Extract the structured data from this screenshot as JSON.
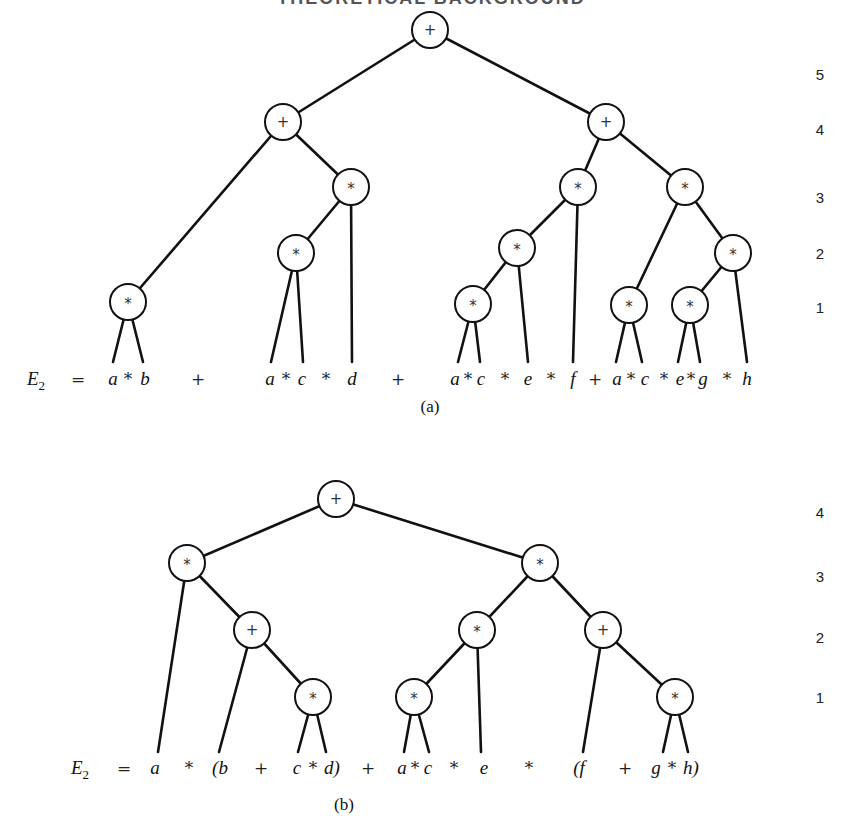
{
  "header": {
    "title": "THEORETICAL BACKGROUND"
  },
  "figures": [
    {
      "id": "a",
      "caption": "(a)",
      "expression_label": "E",
      "expression_subscript": "2",
      "equals": "=",
      "levels": [
        {
          "label": "5",
          "y": 80
        },
        {
          "label": "4",
          "y": 135
        },
        {
          "label": "3",
          "y": 203
        },
        {
          "label": "2",
          "y": 259
        },
        {
          "label": "1",
          "y": 313
        }
      ],
      "nodes": [
        {
          "id": "r",
          "op": "+",
          "x": 430,
          "y": 30
        },
        {
          "id": "n4a",
          "op": "+",
          "x": 283,
          "y": 122
        },
        {
          "id": "n4b",
          "op": "+",
          "x": 606,
          "y": 122
        },
        {
          "id": "n3a",
          "op": "*",
          "x": 351,
          "y": 187
        },
        {
          "id": "n3b",
          "op": "*",
          "x": 578,
          "y": 187
        },
        {
          "id": "n3c",
          "op": "*",
          "x": 685,
          "y": 187
        },
        {
          "id": "n2a",
          "op": "*",
          "x": 296,
          "y": 253
        },
        {
          "id": "n2b",
          "op": "*",
          "x": 517,
          "y": 248
        },
        {
          "id": "n2c",
          "op": "*",
          "x": 733,
          "y": 253
        },
        {
          "id": "n1a",
          "op": "*",
          "x": 128,
          "y": 302
        },
        {
          "id": "n1b",
          "op": "*",
          "x": 473,
          "y": 304
        },
        {
          "id": "n1c",
          "op": "*",
          "x": 629,
          "y": 305
        },
        {
          "id": "n1d",
          "op": "*",
          "x": 690,
          "y": 305
        }
      ],
      "edges": [
        [
          430,
          30,
          283,
          122
        ],
        [
          430,
          30,
          606,
          122
        ],
        [
          283,
          122,
          128,
          302
        ],
        [
          283,
          122,
          351,
          187
        ],
        [
          351,
          187,
          296,
          253
        ],
        [
          351,
          187,
          352,
          362
        ],
        [
          296,
          253,
          271,
          362
        ],
        [
          296,
          253,
          303,
          362
        ],
        [
          128,
          302,
          113,
          362
        ],
        [
          128,
          302,
          143,
          362
        ],
        [
          606,
          122,
          578,
          187
        ],
        [
          606,
          122,
          685,
          187
        ],
        [
          578,
          187,
          517,
          248
        ],
        [
          578,
          187,
          573,
          362
        ],
        [
          517,
          248,
          473,
          304
        ],
        [
          517,
          248,
          528,
          362
        ],
        [
          473,
          304,
          458,
          362
        ],
        [
          473,
          304,
          480,
          362
        ],
        [
          685,
          187,
          629,
          305
        ],
        [
          685,
          187,
          733,
          253
        ],
        [
          629,
          305,
          616,
          362
        ],
        [
          629,
          305,
          642,
          362
        ],
        [
          733,
          253,
          690,
          305
        ],
        [
          733,
          253,
          747,
          362
        ],
        [
          690,
          305,
          678,
          362
        ],
        [
          690,
          305,
          700,
          362
        ]
      ],
      "expression_tokens": [
        {
          "t": "a",
          "x": 113,
          "kind": "var"
        },
        {
          "t": "*",
          "x": 128,
          "kind": "op"
        },
        {
          "t": "b",
          "x": 145,
          "kind": "var"
        },
        {
          "t": "+",
          "x": 198,
          "kind": "op"
        },
        {
          "t": "a",
          "x": 270,
          "kind": "var"
        },
        {
          "t": "*",
          "x": 286,
          "kind": "op"
        },
        {
          "t": "c",
          "x": 302,
          "kind": "var"
        },
        {
          "t": "*",
          "x": 326,
          "kind": "op"
        },
        {
          "t": "d",
          "x": 352,
          "kind": "var"
        },
        {
          "t": "+",
          "x": 398,
          "kind": "op"
        },
        {
          "t": "a",
          "x": 455,
          "kind": "var"
        },
        {
          "t": "*",
          "x": 468,
          "kind": "op"
        },
        {
          "t": "c",
          "x": 481,
          "kind": "var"
        },
        {
          "t": "*",
          "x": 505,
          "kind": "op"
        },
        {
          "t": "e",
          "x": 528,
          "kind": "var"
        },
        {
          "t": "*",
          "x": 551,
          "kind": "op"
        },
        {
          "t": "f",
          "x": 573,
          "kind": "var"
        },
        {
          "t": "+",
          "x": 595,
          "kind": "op"
        },
        {
          "t": "a",
          "x": 617,
          "kind": "var"
        },
        {
          "t": "*",
          "x": 631,
          "kind": "op"
        },
        {
          "t": "c",
          "x": 645,
          "kind": "var"
        },
        {
          "t": "*",
          "x": 664,
          "kind": "op"
        },
        {
          "t": "e",
          "x": 680,
          "kind": "var"
        },
        {
          "t": "*",
          "x": 691,
          "kind": "op"
        },
        {
          "t": "g",
          "x": 703,
          "kind": "var"
        },
        {
          "t": "*",
          "x": 727,
          "kind": "op"
        },
        {
          "t": "h",
          "x": 747,
          "kind": "var"
        }
      ],
      "expression_y": 385,
      "label_x": 36,
      "equals_x": 78,
      "caption_x": 430,
      "caption_y": 412
    },
    {
      "id": "b",
      "caption": "(b)",
      "expression_label": "E",
      "expression_subscript": "2",
      "equals": "=",
      "levels": [
        {
          "label": "4",
          "y": 518
        },
        {
          "label": "3",
          "y": 582
        },
        {
          "label": "2",
          "y": 643
        },
        {
          "label": "1",
          "y": 703
        }
      ],
      "nodes": [
        {
          "id": "r",
          "op": "+",
          "x": 336,
          "y": 499
        },
        {
          "id": "n3a",
          "op": "*",
          "x": 187,
          "y": 563
        },
        {
          "id": "n3b",
          "op": "*",
          "x": 540,
          "y": 563
        },
        {
          "id": "n2a",
          "op": "+",
          "x": 252,
          "y": 630
        },
        {
          "id": "n2b",
          "op": "*",
          "x": 477,
          "y": 630
        },
        {
          "id": "n2c",
          "op": "+",
          "x": 603,
          "y": 630
        },
        {
          "id": "n1a",
          "op": "*",
          "x": 313,
          "y": 697
        },
        {
          "id": "n1b",
          "op": "*",
          "x": 414,
          "y": 697
        },
        {
          "id": "n1c",
          "op": "*",
          "x": 675,
          "y": 697
        }
      ],
      "edges": [
        [
          336,
          499,
          187,
          563
        ],
        [
          336,
          499,
          540,
          563
        ],
        [
          187,
          563,
          158,
          752
        ],
        [
          187,
          563,
          252,
          630
        ],
        [
          252,
          630,
          219,
          752
        ],
        [
          252,
          630,
          313,
          697
        ],
        [
          313,
          697,
          298,
          752
        ],
        [
          313,
          697,
          326,
          752
        ],
        [
          540,
          563,
          477,
          630
        ],
        [
          540,
          563,
          603,
          630
        ],
        [
          477,
          630,
          414,
          697
        ],
        [
          477,
          630,
          481,
          752
        ],
        [
          414,
          697,
          404,
          752
        ],
        [
          414,
          697,
          429,
          752
        ],
        [
          603,
          630,
          583,
          752
        ],
        [
          603,
          630,
          675,
          697
        ],
        [
          675,
          697,
          663,
          752
        ],
        [
          675,
          697,
          688,
          752
        ]
      ],
      "expression_tokens": [
        {
          "t": "a",
          "x": 155,
          "kind": "var"
        },
        {
          "t": "*",
          "x": 189,
          "kind": "op"
        },
        {
          "t": "(b",
          "x": 220,
          "kind": "var"
        },
        {
          "t": "+",
          "x": 261,
          "kind": "op"
        },
        {
          "t": "c",
          "x": 297,
          "kind": "var"
        },
        {
          "t": "*",
          "x": 313,
          "kind": "op"
        },
        {
          "t": "d)",
          "x": 332,
          "kind": "var"
        },
        {
          "t": "+",
          "x": 368,
          "kind": "op"
        },
        {
          "t": "a",
          "x": 402,
          "kind": "var"
        },
        {
          "t": "*",
          "x": 415,
          "kind": "op"
        },
        {
          "t": "c",
          "x": 428,
          "kind": "var"
        },
        {
          "t": "*",
          "x": 454,
          "kind": "op"
        },
        {
          "t": "e",
          "x": 484,
          "kind": "var"
        },
        {
          "t": "*",
          "x": 529,
          "kind": "op"
        },
        {
          "t": "(f",
          "x": 579,
          "kind": "var"
        },
        {
          "t": "+",
          "x": 625,
          "kind": "op"
        },
        {
          "t": "g",
          "x": 656,
          "kind": "var"
        },
        {
          "t": "*",
          "x": 672,
          "kind": "op"
        },
        {
          "t": "h)",
          "x": 691,
          "kind": "var"
        }
      ],
      "expression_y": 774,
      "label_x": 80,
      "equals_x": 124,
      "caption_x": 344,
      "caption_y": 810
    }
  ],
  "level_x": 820,
  "node_radius": 18
}
